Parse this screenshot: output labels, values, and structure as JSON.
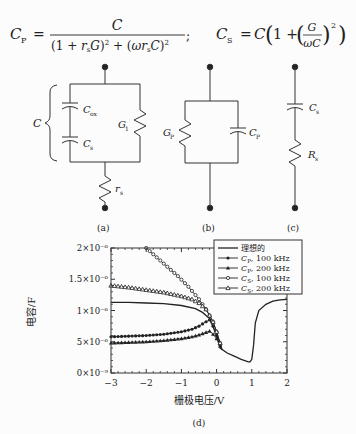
{
  "formulas": {
    "cp": {
      "lhs": "C",
      "lhs_sub": "P",
      "numerator": "C",
      "denominator": "(1 + r_s G)^2 + (ω r_s C)^2",
      "separator": ";"
    },
    "cs": {
      "lhs": "C",
      "lhs_sub": "S",
      "rhs": "C(1 + (G/ωC)^2)"
    }
  },
  "circuits": {
    "a": {
      "caption": "(a)",
      "brace_label": "C",
      "labels": {
        "cox": "C",
        "cox_sub": "ox",
        "cs": "C",
        "cs_sub": "s",
        "g1": "G",
        "g1_sub": "1",
        "rs": "r",
        "rs_sub": "s"
      }
    },
    "b": {
      "caption": "(b)",
      "labels": {
        "gp": "G",
        "gp_sub": "P",
        "cp": "C",
        "cp_sub": "P"
      }
    },
    "c": {
      "caption": "(c)",
      "labels": {
        "cs": "C",
        "cs_sub": "s",
        "rs": "R",
        "rs_sub": "s"
      }
    }
  },
  "chart_caption": "(d)",
  "chart_data": {
    "type": "line",
    "title": "",
    "xlabel": "栅极电压/V",
    "ylabel": "电容/F",
    "xlim": [
      -3,
      2
    ],
    "ylim": [
      0,
      2e-06
    ],
    "xticks": [
      -3,
      -2,
      -1,
      0,
      1,
      2
    ],
    "xtick_labels": [
      "−3",
      "−2",
      "−1",
      "0",
      "1",
      "2"
    ],
    "yticks": [
      0,
      5e-07,
      1e-06,
      1.5e-06,
      2e-06
    ],
    "ytick_labels": [
      "0×10⁻⁹",
      "5×10⁻⁶",
      "1×10⁻⁶",
      "1.5×10⁻⁶",
      "2×10⁻⁶"
    ],
    "grid": false,
    "legend_position": "upper right",
    "series": [
      {
        "name": "理想的",
        "marker": "none",
        "x": [
          -3,
          -2.5,
          -2,
          -1.5,
          -1,
          -0.6,
          -0.4,
          -0.2,
          0,
          0.1,
          0.3,
          0.5,
          0.7,
          0.9,
          0.95,
          1.0,
          1.05,
          1.1,
          1.2,
          1.4,
          1.6,
          1.8,
          2.0
        ],
        "y": [
          1.13e-06,
          1.13e-06,
          1.12e-06,
          1.11e-06,
          1.08e-06,
          1.03e-06,
          9.7e-07,
          8.7e-07,
          6e-07,
          4e-07,
          3.2e-07,
          2.7e-07,
          2.2e-07,
          1.8e-07,
          1.8e-07,
          2.2e-07,
          4.5e-07,
          8e-07,
          1e-06,
          1.1e-06,
          1.15e-06,
          1.17e-06,
          1.18e-06
        ]
      },
      {
        "name": "C_P, 100 kHz",
        "marker": "filled-circle",
        "x": [
          -3,
          -2.5,
          -2,
          -1.5,
          -1,
          -0.7,
          -0.5,
          -0.3,
          -0.2,
          -0.1,
          0,
          0.1,
          0.15
        ],
        "y": [
          5.8e-07,
          5.9e-07,
          6e-07,
          6.2e-07,
          6.6e-07,
          7e-07,
          7.5e-07,
          8.2e-07,
          8.5e-07,
          7.5e-07,
          6e-07,
          4.5e-07,
          3.8e-07
        ]
      },
      {
        "name": "C_P, 200 kHz",
        "marker": "filled-triangle",
        "x": [
          -3,
          -2.5,
          -2,
          -1.5,
          -1,
          -0.7,
          -0.5,
          -0.3,
          -0.2,
          -0.1,
          0,
          0.1,
          0.15
        ],
        "y": [
          4.8e-07,
          4.9e-07,
          5e-07,
          5.2e-07,
          5.5e-07,
          5.8e-07,
          6.1e-07,
          6.5e-07,
          6.7e-07,
          6.2e-07,
          5.5e-07,
          4.3e-07,
          3.7e-07
        ]
      },
      {
        "name": "C_S, 100 kHz",
        "marker": "open-circle",
        "x": [
          -2.0,
          -1.7,
          -1.4,
          -1.1,
          -0.8,
          -0.5,
          -0.3,
          -0.1,
          0,
          0.1,
          0.15
        ],
        "y": [
          2e-06,
          1.85e-06,
          1.7e-06,
          1.55e-06,
          1.38e-06,
          1.18e-06,
          1.02e-06,
          8.2e-07,
          6.6e-07,
          4.8e-07,
          3.8e-07
        ]
      },
      {
        "name": "C_S, 200 kHz",
        "marker": "open-triangle",
        "x": [
          -3,
          -2.5,
          -2,
          -1.5,
          -1,
          -0.7,
          -0.5,
          -0.3,
          -0.1,
          0,
          0.1,
          0.15
        ],
        "y": [
          1.4e-06,
          1.37e-06,
          1.33e-06,
          1.29e-06,
          1.23e-06,
          1.18e-06,
          1.12e-06,
          1.02e-06,
          8.2e-07,
          6.6e-07,
          4.8e-07,
          3.8e-07
        ]
      }
    ],
    "legend": [
      "理想的",
      "C_P, 100 kHz",
      "C_P, 200 kHz",
      "C_S, 100 kHz",
      "C_S, 200 kHz"
    ]
  },
  "legend_display": [
    {
      "main": "理想的",
      "sub": "",
      "rest": ""
    },
    {
      "main": "C",
      "sub": "P",
      "rest": ", 100 kHz"
    },
    {
      "main": "C",
      "sub": "P",
      "rest": ", 200 kHz"
    },
    {
      "main": "C",
      "sub": "S",
      "rest": ", 100 kHz"
    },
    {
      "main": "C",
      "sub": "S",
      "rest": ", 200 kHz"
    }
  ]
}
